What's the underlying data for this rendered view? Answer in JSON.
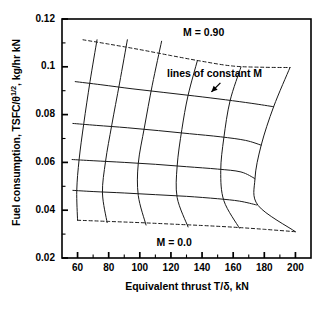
{
  "chart_data": {
    "type": "line",
    "title": "",
    "xlabel": "Equivalent thrust T/δ, kN",
    "ylabel_prefix": "Fuel consumption, TSFC/θ",
    "ylabel_sup": "1/2",
    "ylabel_suffix": ", kg/hr kN",
    "ylabel_full": "Fuel consumption, TSFC/θ 1/2, kg/hr kN",
    "xlim": [
      50,
      210
    ],
    "ylim": [
      0.02,
      0.12
    ],
    "xticks": [
      "60",
      "80",
      "100",
      "120",
      "140",
      "160",
      "180",
      "200"
    ],
    "xtick_values": [
      60,
      80,
      100,
      120,
      140,
      160,
      180,
      200
    ],
    "yticks": [
      "0.02",
      "0.04",
      "0.06",
      "0.08",
      "0.1",
      "0.12"
    ],
    "ytick_values": [
      0.02,
      0.04,
      0.06,
      0.08,
      0.1,
      0.12
    ],
    "minor_ytick_values": [
      0.03,
      0.05,
      0.07,
      0.09,
      0.11
    ],
    "minor_xtick_values": [
      70,
      90,
      110,
      130,
      150,
      170,
      190
    ],
    "grid": false,
    "legend": "none",
    "line_color": "#1a1a1a",
    "annotations": [
      {
        "name": "m-high-label",
        "text": "M = 0.90",
        "x": 141,
        "y": 0.1145
      },
      {
        "name": "constant-m-label",
        "text": "lines of constant M",
        "x": 148,
        "y": 0.0975
      },
      {
        "name": "m-zero-label",
        "text": "M = 0.0",
        "x": 122,
        "y": 0.0265
      },
      {
        "name": "arrow-to-constant-m",
        "text": "",
        "x": 146,
        "y": 0.0895
      }
    ],
    "mach_lines": [
      {
        "name": "M = 0.90",
        "mach": 0.9,
        "style": "dashed",
        "points": [
          [
            63.5,
            0.1113
          ],
          [
            80,
            0.1095
          ],
          [
            100,
            0.1072
          ],
          [
            120,
            0.1047
          ],
          [
            140,
            0.1023
          ],
          [
            160,
            0.1003
          ],
          [
            180,
            0.0998
          ],
          [
            196.5,
            0.0997
          ]
        ]
      },
      {
        "name": "M = 0.675",
        "mach": 0.675,
        "style": "solid",
        "points": [
          [
            58.5,
            0.0938
          ],
          [
            75,
            0.0925
          ],
          [
            95,
            0.0908
          ],
          [
            115,
            0.0893
          ],
          [
            135,
            0.0878
          ],
          [
            155,
            0.0862
          ],
          [
            172,
            0.0847
          ],
          [
            186,
            0.0833
          ]
        ]
      },
      {
        "name": "M = 0.45",
        "mach": 0.45,
        "style": "solid",
        "points": [
          [
            57,
            0.0763
          ],
          [
            72,
            0.0755
          ],
          [
            92,
            0.0745
          ],
          [
            112,
            0.0733
          ],
          [
            132,
            0.072
          ],
          [
            152,
            0.0707
          ],
          [
            168,
            0.0692
          ],
          [
            178,
            0.0672
          ]
        ]
      },
      {
        "name": "M = 0.225",
        "mach": 0.225,
        "style": "solid",
        "points": [
          [
            56.5,
            0.0612
          ],
          [
            70,
            0.0607
          ],
          [
            90,
            0.06
          ],
          [
            110,
            0.0592
          ],
          [
            130,
            0.0582
          ],
          [
            150,
            0.0572
          ],
          [
            165,
            0.056
          ],
          [
            174,
            0.0532
          ]
        ]
      },
      {
        "name": "M = 0.1",
        "mach": 0.1,
        "style": "solid",
        "points": [
          [
            57,
            0.0483
          ],
          [
            70,
            0.0478
          ],
          [
            90,
            0.0472
          ],
          [
            110,
            0.0465
          ],
          [
            130,
            0.0458
          ],
          [
            150,
            0.0448
          ],
          [
            164,
            0.0438
          ],
          [
            175,
            0.0422
          ]
        ]
      },
      {
        "name": "M = 0.0",
        "mach": 0.0,
        "style": "dashed",
        "points": [
          [
            60,
            0.0358
          ],
          [
            80,
            0.0353
          ],
          [
            100,
            0.0348
          ],
          [
            120,
            0.0342
          ],
          [
            140,
            0.0336
          ],
          [
            160,
            0.0329
          ],
          [
            180,
            0.032
          ],
          [
            200,
            0.031
          ]
        ]
      }
    ],
    "rpm_lines": [
      {
        "name": "rating-curve-1",
        "style": "solid",
        "points": [
          [
            72.5,
            0.1113
          ],
          [
            68,
            0.0938
          ],
          [
            64,
            0.0763
          ],
          [
            61,
            0.0612
          ],
          [
            59.5,
            0.0483
          ],
          [
            60,
            0.0358
          ]
        ]
      },
      {
        "name": "rating-curve-2",
        "style": "solid",
        "points": [
          [
            92,
            0.1113
          ],
          [
            87,
            0.0932
          ],
          [
            82,
            0.0757
          ],
          [
            78,
            0.0605
          ],
          [
            76,
            0.0472
          ],
          [
            79,
            0.0348
          ]
        ]
      },
      {
        "name": "rating-curve-3",
        "style": "solid",
        "points": [
          [
            114,
            0.1107
          ],
          [
            108,
            0.0923
          ],
          [
            103,
            0.0748
          ],
          [
            99,
            0.0595
          ],
          [
            99,
            0.0462
          ],
          [
            104,
            0.0338
          ]
        ]
      },
      {
        "name": "rating-curve-4",
        "style": "solid",
        "points": [
          [
            137,
            0.1026
          ],
          [
            131,
            0.088
          ],
          [
            127,
            0.0737
          ],
          [
            124,
            0.0585
          ],
          [
            124,
            0.0453
          ],
          [
            131,
            0.033
          ]
        ]
      },
      {
        "name": "rating-curve-5",
        "style": "solid",
        "points": [
          [
            165,
            0.0999
          ],
          [
            158,
            0.0858
          ],
          [
            154,
            0.0703
          ],
          [
            152,
            0.0565
          ],
          [
            154,
            0.044
          ],
          [
            164,
            0.0325
          ]
        ]
      },
      {
        "name": "rating-curve-6",
        "style": "solid",
        "points": [
          [
            196.5,
            0.0997
          ],
          [
            186,
            0.0833
          ],
          [
            178,
            0.0672
          ],
          [
            174,
            0.0532
          ],
          [
            176,
            0.042
          ],
          [
            200,
            0.031
          ]
        ]
      }
    ]
  }
}
